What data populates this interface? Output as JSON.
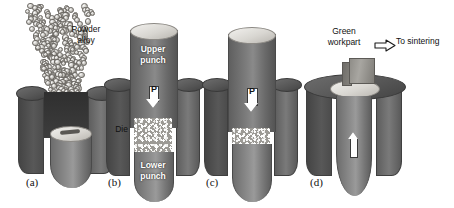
{
  "figure": {
    "background_color": "#ffffff",
    "ink_color": "#111111",
    "panel_count": 4
  },
  "palette": {
    "die_dark": "#4e4e4e",
    "die_mid": "#6a6a6a",
    "punch_gray": "#7d7d7d",
    "powder_gray": "#9c9a95",
    "highlight": "#ffffff",
    "top_face_light": "#e2e0db"
  },
  "panels": [
    {
      "id": "a",
      "caption": "(a)",
      "description": "Loose powder alloy poured into the die cavity",
      "labels": [
        {
          "name": "powder-alloy-label",
          "text": "Powder\nalloy"
        }
      ]
    },
    {
      "id": "b",
      "caption": "(b)",
      "description": "Die filled with loose powder between upper and lower punch",
      "labels": [
        {
          "name": "upper-punch-label",
          "text": "Upper\npunch"
        },
        {
          "name": "die-label",
          "text": "Die"
        },
        {
          "name": "lower-punch-label",
          "text": "Lower\npunch"
        },
        {
          "name": "force-label",
          "text": "P"
        }
      ]
    },
    {
      "id": "c",
      "caption": "(c)",
      "description": "Upper punch advances under pressure P, compacting the powder",
      "labels": [
        {
          "name": "force-label",
          "text": "P"
        }
      ]
    },
    {
      "id": "d",
      "caption": "(d)",
      "description": "Lower punch ejects the green compact from the die",
      "labels": [
        {
          "name": "green-workpart-label",
          "text": "Green\nworkpart"
        },
        {
          "name": "to-sintering-label",
          "text": "To sintering"
        }
      ]
    }
  ],
  "captions": {
    "a": "(a)",
    "b": "(b)",
    "c": "(c)",
    "d": "(d)"
  },
  "annotations": {
    "powder_alloy": "Powder\nalloy",
    "upper_punch": "Upper\npunch",
    "die": "Die",
    "lower_punch": "Lower\npunch",
    "force_b": "P",
    "force_c": "P",
    "green_workpart": "Green\nworkpart",
    "to_sintering": "To sintering"
  }
}
